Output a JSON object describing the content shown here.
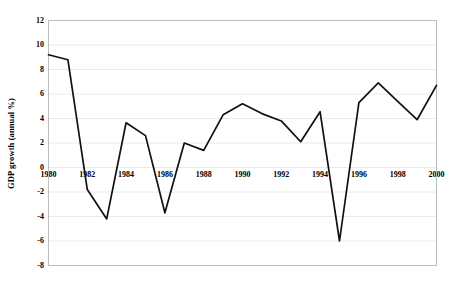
{
  "chart_data": {
    "type": "line",
    "title": "",
    "subtitle": "",
    "xlabel": "",
    "ylabel": "GDP growth (annual %)",
    "x": [
      1980,
      1981,
      1982,
      1983,
      1984,
      1985,
      1986,
      1987,
      1988,
      1989,
      1990,
      1991,
      1992,
      1993,
      1994,
      1995,
      1996,
      1997,
      1998,
      1999,
      2000
    ],
    "values": [
      9.2,
      8.8,
      -1.8,
      -4.2,
      3.65,
      2.6,
      -3.7,
      2.0,
      1.4,
      4.3,
      5.2,
      4.4,
      3.8,
      2.1,
      4.55,
      -6.0,
      5.3,
      6.9,
      5.4,
      3.9,
      6.7
    ],
    "series": [
      {
        "name": "GDP growth (annual %)",
        "values": [
          9.2,
          8.8,
          -1.8,
          -4.2,
          3.65,
          2.6,
          -3.7,
          2.0,
          1.4,
          4.3,
          5.2,
          4.4,
          3.8,
          2.1,
          4.55,
          -6.0,
          5.3,
          6.9,
          5.4,
          3.9,
          6.7
        ]
      }
    ],
    "xlim": [
      1980,
      2000
    ],
    "ylim": [
      -8,
      12
    ],
    "ytick_labels": [
      "12",
      "10",
      "8",
      "6",
      "4",
      "2",
      "0",
      "-2",
      "-4",
      "-6",
      "-8"
    ],
    "ytick_values": [
      12,
      10,
      8,
      6,
      4,
      2,
      0,
      -2,
      -4,
      -6,
      -8
    ],
    "xtick_labels": [
      "1980",
      "1982",
      "1984",
      "1986",
      "1988",
      "1990",
      "1992",
      "1994",
      "1996",
      "1998",
      "2000"
    ],
    "xtick_values": [
      1980,
      1982,
      1984,
      1986,
      1988,
      1990,
      1992,
      1994,
      1996,
      1998,
      2000
    ],
    "grid": "horizontal",
    "legend": "none",
    "line_color": "#111111",
    "grid_color": "#e8eaee",
    "frame_color": "#b9bdc4",
    "background_color": "#ffffff"
  }
}
